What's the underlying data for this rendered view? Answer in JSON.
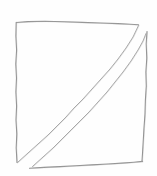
{
  "canvas": {
    "width": 157,
    "height": 176,
    "background_color": "#fefefe",
    "description": "hand-drawn pencil sketch"
  },
  "drawing": {
    "title": "hand-drawn square with two parallel diagonals",
    "medium": "pencil",
    "stroke_color": "#9a9a9a",
    "stroke_color_light": "#b5b5b5",
    "stroke_width": 1,
    "shapes": [
      {
        "name": "square-top-edge",
        "type": "line",
        "stroke_color": "#8e8e8e",
        "stroke_width": 1.1,
        "path": "M16.5,22.5 L28,21.6 L45,21.2 L64,21.8 L82,22.4 L100,23.0 L118,23.6 L130,24.2 L138.5,24.8"
      },
      {
        "name": "square-left-edge",
        "type": "line",
        "stroke_color": "#8e8e8e",
        "stroke_width": 1.1,
        "path": "M16.2,22.2 L15.9,36 L16.6,50 L15.8,64 L16.5,78 L15.9,92 L16.6,106 L16.0,120 L16.8,134 L16.2,148 L17.0,162.5"
      },
      {
        "name": "square-right-edge",
        "type": "line",
        "stroke_color": "#8e8e8e",
        "stroke_width": 1.1,
        "path": "M147.0,31.5 L146.2,44 L146.8,58 L145.9,72 L146.3,86 L145.4,100 L145.0,114 L144.0,128 L143.2,142 L142.6,152 L142.0,161.5"
      },
      {
        "name": "square-bottom-edge",
        "type": "line",
        "stroke_color": "#8e8e8e",
        "stroke_width": 1.1,
        "path": "M29.5,168.2 L44,167.4 L60,166.6 L76,165.8 L92,164.9 L108,164.0 L122,163.1 L134,162.2 L142.5,161.4"
      },
      {
        "name": "diagonal-line-upper-left",
        "type": "line",
        "stroke_color": "#a8a8a8",
        "stroke_width": 1.0,
        "path": "M17.5,162.5 L28,153 L38,144 L48,135 L57,126 L66,117 L74,108 L83,99 L92,89 L101,79 L110,69 L118,59 L126,48 L133,37 L138.5,25.5"
      },
      {
        "name": "diagonal-line-lower-right",
        "type": "line",
        "stroke_color": "#a8a8a8",
        "stroke_width": 1.0,
        "path": "M32.5,166.5 L43,157 L53,148 L62,139 L71,130 L80,121 L89,112 L98,102 L107,92 L115,82 L123,72 L131,61 L138,50 L143,41 L146.0,33.5"
      }
    ]
  }
}
